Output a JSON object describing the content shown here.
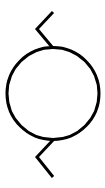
{
  "diagram": {
    "type": "schematic-symbol",
    "symbol": "circle-with-zigzag-leads",
    "stroke_color": "#000000",
    "background_color": "#ffffff",
    "stroke_width": 3,
    "circle": {
      "cx": 53,
      "cy": 93.5,
      "r": 46
    },
    "top_lead": {
      "points": "53,12 37,29 52,47"
    },
    "bottom_lead": {
      "points": "53,140 37,157 53,177"
    }
  }
}
